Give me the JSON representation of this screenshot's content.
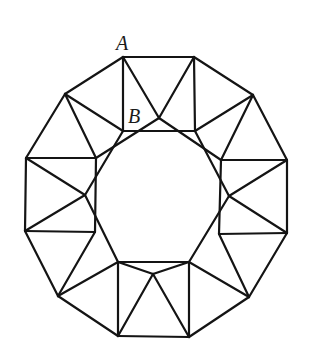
{
  "figure": {
    "stroke_color": "#141414",
    "background": "#ffffff"
  },
  "labels": {
    "A": "A",
    "B": "B"
  },
  "label_positions": {
    "A": {
      "x": 116,
      "y": 33
    },
    "B": {
      "x": 128,
      "y": 106
    }
  },
  "geometry": {
    "outer_vertices": [
      [
        123,
        57
      ],
      [
        194,
        57
      ],
      [
        253,
        95
      ],
      [
        287,
        160
      ],
      [
        287,
        233
      ],
      [
        249,
        297
      ],
      [
        189,
        337
      ],
      [
        118,
        336
      ],
      [
        58,
        296
      ],
      [
        25,
        231
      ],
      [
        26,
        158
      ],
      [
        65,
        94
      ]
    ],
    "inner_vertices": [
      [
        123,
        131
      ],
      [
        195,
        131
      ],
      [
        221,
        160
      ],
      [
        219,
        234
      ],
      [
        189,
        262
      ],
      [
        118,
        262
      ],
      [
        95,
        232
      ],
      [
        96,
        158
      ]
    ],
    "triangle_apices": [
      [
        159,
        118
      ],
      [
        229,
        196
      ],
      [
        153,
        274
      ],
      [
        85,
        195
      ]
    ],
    "segments": [
      [
        [
          123,
          57
        ],
        [
          194,
          57
        ]
      ],
      [
        [
          194,
          57
        ],
        [
          253,
          95
        ]
      ],
      [
        [
          253,
          95
        ],
        [
          287,
          160
        ]
      ],
      [
        [
          287,
          160
        ],
        [
          287,
          233
        ]
      ],
      [
        [
          287,
          233
        ],
        [
          249,
          297
        ]
      ],
      [
        [
          249,
          297
        ],
        [
          189,
          337
        ]
      ],
      [
        [
          189,
          337
        ],
        [
          118,
          336
        ]
      ],
      [
        [
          118,
          336
        ],
        [
          58,
          296
        ]
      ],
      [
        [
          58,
          296
        ],
        [
          25,
          231
        ]
      ],
      [
        [
          25,
          231
        ],
        [
          26,
          158
        ]
      ],
      [
        [
          26,
          158
        ],
        [
          65,
          94
        ]
      ],
      [
        [
          65,
          94
        ],
        [
          123,
          57
        ]
      ],
      [
        [
          123,
          57
        ],
        [
          123,
          131
        ]
      ],
      [
        [
          194,
          57
        ],
        [
          195,
          131
        ]
      ],
      [
        [
          123,
          131
        ],
        [
          195,
          131
        ]
      ],
      [
        [
          287,
          160
        ],
        [
          221,
          160
        ]
      ],
      [
        [
          287,
          233
        ],
        [
          219,
          234
        ]
      ],
      [
        [
          221,
          160
        ],
        [
          219,
          234
        ]
      ],
      [
        [
          189,
          337
        ],
        [
          189,
          262
        ]
      ],
      [
        [
          118,
          336
        ],
        [
          118,
          262
        ]
      ],
      [
        [
          189,
          262
        ],
        [
          118,
          262
        ]
      ],
      [
        [
          25,
          231
        ],
        [
          95,
          232
        ]
      ],
      [
        [
          26,
          158
        ],
        [
          96,
          158
        ]
      ],
      [
        [
          96,
          158
        ],
        [
          95,
          232
        ]
      ],
      [
        [
          123,
          57
        ],
        [
          159,
          118
        ]
      ],
      [
        [
          194,
          57
        ],
        [
          159,
          118
        ]
      ],
      [
        [
          159,
          118
        ],
        [
          221,
          160
        ]
      ],
      [
        [
          159,
          118
        ],
        [
          96,
          158
        ]
      ],
      [
        [
          287,
          160
        ],
        [
          229,
          196
        ]
      ],
      [
        [
          287,
          233
        ],
        [
          229,
          196
        ]
      ],
      [
        [
          229,
          196
        ],
        [
          195,
          131
        ]
      ],
      [
        [
          229,
          196
        ],
        [
          189,
          262
        ]
      ],
      [
        [
          189,
          262
        ],
        [
          153,
          274
        ]
      ],
      [
        [
          118,
          262
        ],
        [
          153,
          274
        ]
      ],
      [
        [
          153,
          274
        ],
        [
          189,
          337
        ]
      ],
      [
        [
          153,
          274
        ],
        [
          118,
          336
        ]
      ],
      [
        [
          26,
          158
        ],
        [
          85,
          195
        ]
      ],
      [
        [
          25,
          231
        ],
        [
          85,
          195
        ]
      ],
      [
        [
          85,
          195
        ],
        [
          123,
          131
        ]
      ],
      [
        [
          85,
          195
        ],
        [
          118,
          262
        ]
      ],
      [
        [
          65,
          94
        ],
        [
          96,
          158
        ]
      ],
      [
        [
          65,
          94
        ],
        [
          123,
          131
        ]
      ],
      [
        [
          253,
          95
        ],
        [
          195,
          131
        ]
      ],
      [
        [
          253,
          95
        ],
        [
          221,
          160
        ]
      ],
      [
        [
          249,
          297
        ],
        [
          219,
          234
        ]
      ],
      [
        [
          249,
          297
        ],
        [
          189,
          262
        ]
      ],
      [
        [
          58,
          296
        ],
        [
          95,
          232
        ]
      ],
      [
        [
          58,
          296
        ],
        [
          118,
          262
        ]
      ]
    ]
  }
}
